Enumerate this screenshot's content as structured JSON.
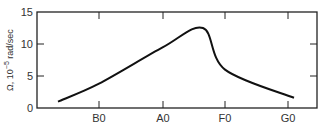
{
  "chart_data": {
    "type": "line",
    "title": "",
    "xlabel": "",
    "ylabel": "Ω, 10⁻⁵ rad/sec",
    "ylim": [
      0,
      15
    ],
    "y_ticks": [
      "0",
      "5",
      "10",
      "15"
    ],
    "x_ticks": [
      "B0",
      "A0",
      "F0",
      "G0"
    ],
    "grid": false,
    "legend": null,
    "series": [
      {
        "name": "Ω",
        "color": "#111111",
        "points": [
          {
            "x": "before B0",
            "y": 1.0
          },
          {
            "x": "B0",
            "y": 3.8
          },
          {
            "x": "A0",
            "y": 9.5
          },
          {
            "x": "between A0 and F0 (peak)",
            "y": 12.5
          },
          {
            "x": "F0",
            "y": 6.0
          },
          {
            "x": "G0",
            "y": 1.6
          }
        ]
      }
    ]
  },
  "axis": {
    "y_label_main": "Ω,",
    "y_label_exp": "10",
    "y_label_sup": "−5",
    "y_label_unit": "rad/sec"
  }
}
